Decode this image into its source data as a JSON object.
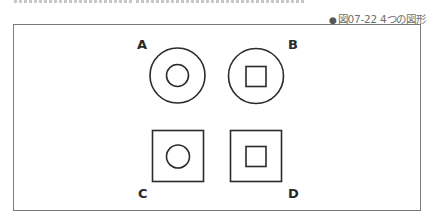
{
  "caption": {
    "bullet": "●",
    "text": "図07-22 4つの図形"
  },
  "figure": {
    "stroke_color": "#2b2b2b",
    "frame_color": "#7a7a7a",
    "shapes": [
      {
        "label": "A",
        "outer": "circle",
        "inner": "circle"
      },
      {
        "label": "B",
        "outer": "circle",
        "inner": "square"
      },
      {
        "label": "C",
        "outer": "square",
        "inner": "circle"
      },
      {
        "label": "D",
        "outer": "square",
        "inner": "square"
      }
    ]
  }
}
